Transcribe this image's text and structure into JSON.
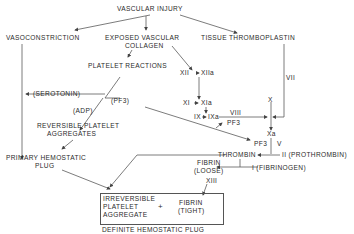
{
  "diagram": {
    "title": "VASCULAR INJURY",
    "nodes": {
      "vascular_injury": "VASCULAR  INJURY",
      "vasoconstriction": "VASOCONSTRICTION",
      "exposed_collagen_1": "EXPOSED VASCULAR",
      "exposed_collagen_2": "COLLAGEN",
      "tissue_thromboplastin": "TISSUE  THROMBOPLASTIN",
      "platelet_reactions": "PLATELET  REACTIONS",
      "xii": "XII",
      "xiia": "XIIa",
      "xi": "XI",
      "xia": "XIa",
      "ix": "IX",
      "ixa": "IXa",
      "viii": "VIII",
      "pf3_top": "PF3",
      "vii": "VII",
      "x": "X",
      "xa": "Xa",
      "pf3_right": "PF3",
      "v": "V",
      "serotonin": "(SEROTONIN)",
      "pf3_mid": "(PF3)",
      "adp": "(ADP)",
      "reversible_1": "REVERSIBLE  PLATELET",
      "reversible_2": "AGGREGATES",
      "primary_1": "PRIMARY  HEMOSTATIC",
      "primary_2": "PLUG",
      "thrombin": "THROMBIN",
      "prothrombin": "II (PROTHROMBIN)",
      "fibrin_loose_1": "FIBRIN",
      "fibrin_loose_2": "(LOOSE)",
      "fibrinogen": "I (FIBRINOGEN)",
      "xiii": "XIII",
      "irreversible_1": "IRREVERSIBLE",
      "irreversible_2": "PLATELET",
      "irreversible_3": "AGGREGATE",
      "plus": "+",
      "fibrin_tight_1": "FIBRIN",
      "fibrin_tight_2": "(TIGHT)",
      "definite_plug": "DEFINITE  HEMOSTATIC PLUG"
    }
  }
}
